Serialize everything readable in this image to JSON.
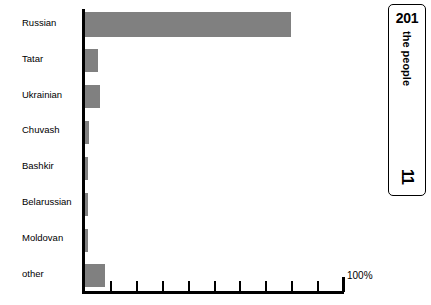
{
  "chart_data": {
    "type": "bar",
    "orientation": "horizontal",
    "title": "",
    "xlabel": "",
    "ylabel": "",
    "categories": [
      "Russian",
      "Tatar",
      "Ukrainian",
      "Chuvash",
      "Bashkir",
      "Belarussian",
      "Moldovan",
      "other"
    ],
    "values": [
      80,
      5.5,
      6,
      2,
      1.5,
      1.5,
      1.5,
      8
    ],
    "xlim": [
      0,
      100
    ],
    "axis_max_label": "100%",
    "tick_percent_step": 10,
    "tick_count": 10,
    "grid": false,
    "legend": "none",
    "bar_color": "#808080",
    "axis_color": "#000000"
  },
  "side_panel": {
    "number_top": "201",
    "vertical_label": "the people",
    "number_bottom": "11"
  }
}
